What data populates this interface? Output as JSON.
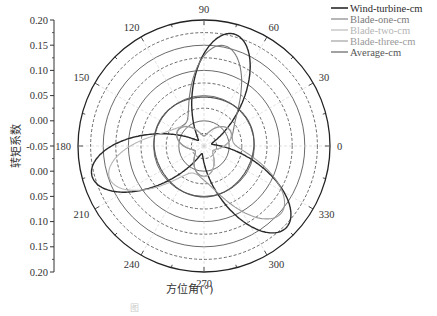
{
  "chart_data": {
    "type": "line",
    "subtype": "polar",
    "title": "",
    "xlabel": "方位角(°)",
    "ylabel": "转矩系数",
    "radial_ticks": [
      "0.20",
      "0.15",
      "0.10",
      "0.05",
      "0.00",
      "-0.05",
      "0.00",
      "0.05",
      "0.10",
      "0.15",
      "0.20"
    ],
    "radial_range": [
      -0.05,
      0.2
    ],
    "ring_step": 0.025,
    "angular_ticks": [
      "0",
      "30",
      "60",
      "90",
      "120",
      "150",
      "180",
      "210",
      "240",
      "270",
      "300",
      "330"
    ],
    "grid": true,
    "legend_position": "top-right",
    "legend": [
      "Wind-turbine-cm",
      "Blade-one-cm",
      "Blade-two-cm",
      "Blade-three-cm",
      "Average-cm"
    ],
    "series": [
      {
        "name": "Wind-turbine-cm",
        "color": "#2a2a2a",
        "width": 1.4,
        "petal_angles_deg": [
          75,
          195,
          315
        ],
        "peak": 0.18,
        "base": -0.045,
        "petal_width": 2.2
      },
      {
        "name": "Blade-one-cm",
        "color": "#7a7a7a",
        "width": 1.1,
        "petal_angles_deg": [
          80
        ],
        "peak": 0.17,
        "base": -0.01,
        "petal_width": 2.0,
        "inner_lobe": 0.02
      },
      {
        "name": "Blade-two-cm",
        "color": "#b5b5b5",
        "width": 1.1,
        "petal_angles_deg": [
          200
        ],
        "peak": 0.165,
        "base": -0.01,
        "petal_width": 2.0,
        "inner_lobe": 0.02
      },
      {
        "name": "Blade-three-cm",
        "color": "#999999",
        "width": 1.1,
        "petal_angles_deg": [
          320
        ],
        "peak": 0.17,
        "base": -0.01,
        "petal_width": 2.0,
        "inner_lobe": 0.02
      },
      {
        "name": "Average-cm",
        "color": "#555555",
        "width": 1.2,
        "constant": 0.049
      }
    ]
  },
  "caption": "图"
}
